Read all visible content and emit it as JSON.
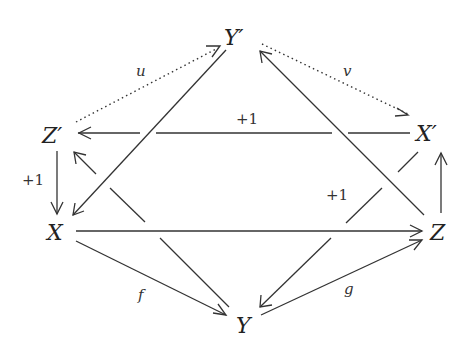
{
  "diagram": {
    "type": "commutative-diagram",
    "nodes": {
      "Yp": "Y′",
      "Zp": "Z′",
      "Xp": "X′",
      "X": "X",
      "Z": "Z",
      "Y": "Y"
    },
    "edge_labels": {
      "u": "u",
      "v": "v",
      "f": "f",
      "g": "g",
      "shift_top": "+1",
      "shift_left": "+1",
      "shift_right": "+1"
    },
    "edges": [
      {
        "from": "Z′",
        "to": "Y′",
        "label": "u",
        "style": "dotted"
      },
      {
        "from": "Y′",
        "to": "X′",
        "label": "v",
        "style": "dotted"
      },
      {
        "from": "X′",
        "to": "Z′",
        "label": "+1",
        "style": "solid"
      },
      {
        "from": "Z′",
        "to": "X",
        "label": "+1",
        "style": "solid"
      },
      {
        "from": "Y′",
        "to": "X",
        "label": "",
        "style": "solid"
      },
      {
        "from": "Z",
        "to": "Y′",
        "label": "",
        "style": "solid"
      },
      {
        "from": "Y",
        "to": "Z′",
        "label": "",
        "style": "solid"
      },
      {
        "from": "X′",
        "to": "Y",
        "label": "+1",
        "style": "solid"
      },
      {
        "from": "X",
        "to": "Z",
        "label": "",
        "style": "solid"
      },
      {
        "from": "X",
        "to": "Y",
        "label": "f",
        "style": "solid"
      },
      {
        "from": "Y",
        "to": "Z",
        "label": "g",
        "style": "solid"
      },
      {
        "from": "Z",
        "to": "X′",
        "label": "",
        "style": "solid"
      }
    ]
  }
}
